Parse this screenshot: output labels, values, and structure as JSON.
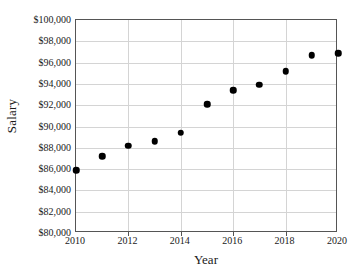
{
  "chart_data": {
    "type": "scatter",
    "title": "",
    "xlabel": "Year",
    "ylabel": "Salary",
    "x": [
      2010,
      2011,
      2012,
      2013,
      2014,
      2015,
      2016,
      2017,
      2018,
      2019,
      2020
    ],
    "values": [
      85900,
      87200,
      88200,
      88600,
      89400,
      92100,
      93400,
      93900,
      95200,
      96700,
      96900
    ],
    "xlim": [
      2010,
      2020
    ],
    "ylim": [
      80000,
      100000
    ],
    "x_tick_values": [
      2010,
      2012,
      2014,
      2016,
      2018,
      2020
    ],
    "x_tick_labels": [
      "2010",
      "2012",
      "2014",
      "2016",
      "2018",
      "2020"
    ],
    "y_tick_values": [
      80000,
      82000,
      84000,
      86000,
      88000,
      90000,
      92000,
      94000,
      96000,
      98000,
      100000
    ],
    "y_tick_labels": [
      "$80,000",
      "$82,000",
      "$84,000",
      "$86,000",
      "$88,000",
      "$90,000",
      "$92,000",
      "$94,000",
      "$96,000",
      "$98,000",
      "$100,000"
    ],
    "grid": true,
    "grid_axis": "y",
    "legend": false,
    "legend_position": "none",
    "marker": "circle",
    "marker_color": "#000000",
    "plot_background": "#ffffff",
    "frame_color": "#555555",
    "gridline_color": "#d4d4d4"
  }
}
